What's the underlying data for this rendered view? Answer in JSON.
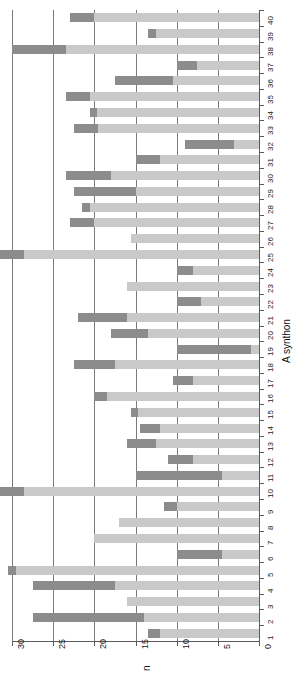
{
  "chart_data": {
    "type": "bar",
    "orientation": "horizontal-rotated",
    "title": "",
    "xlabel": "n",
    "ylabel": "A synthon",
    "xlim": [
      0,
      30
    ],
    "xticks": [
      30,
      25,
      20,
      15,
      10,
      5,
      0
    ],
    "xtick_labels": [
      "30",
      "25",
      "20",
      "15",
      "10",
      "5",
      "0"
    ],
    "grid": true,
    "legend": "none",
    "categories": [
      "1",
      "2",
      "3",
      "4",
      "5",
      "6",
      "7",
      "8",
      "9",
      "10",
      "11",
      "12",
      "13",
      "14",
      "15",
      "16",
      "17",
      "18",
      "19",
      "20",
      "21",
      "22",
      "23",
      "24",
      "25",
      "26",
      "27",
      "28",
      "29",
      "30",
      "31",
      "32",
      "33",
      "34",
      "35",
      "36",
      "37",
      "38",
      "39",
      "40"
    ],
    "series": [
      {
        "name": "total",
        "color": "#c9c9c9",
        "values": [
          13.5,
          27.5,
          16.0,
          27.5,
          30.5,
          10.0,
          20.0,
          17.0,
          11.5,
          31.5,
          15.0,
          11.0,
          16.0,
          14.5,
          15.5,
          20.0,
          10.5,
          22.5,
          10.0,
          18.0,
          22.0,
          10.0,
          16.0,
          10.0,
          32.5,
          15.5,
          23.0,
          21.5,
          22.5,
          23.5,
          15.0,
          9.0,
          22.5,
          20.5,
          23.5,
          17.5,
          10.0,
          30.0,
          13.5,
          23.0
        ]
      },
      {
        "name": "segment",
        "color": "#8c8c8c",
        "values": [
          1.5,
          13.5,
          0.0,
          10.0,
          1.0,
          5.5,
          0.0,
          0.0,
          1.5,
          3.0,
          10.5,
          3.0,
          3.5,
          2.5,
          0.8,
          1.5,
          2.5,
          5.0,
          9.0,
          4.5,
          6.0,
          3.0,
          0.0,
          2.0,
          4.0,
          0.0,
          3.0,
          1.0,
          7.5,
          5.5,
          3.0,
          6.0,
          3.0,
          0.8,
          3.0,
          7.0,
          2.5,
          6.5,
          1.0,
          3.0
        ]
      }
    ]
  },
  "axes": {
    "x_title": "n",
    "y_title": "A synthon"
  },
  "colors": {
    "light_bar": "#c9c9c9",
    "dark_bar": "#8c8c8c",
    "axis": "#5b5b5b",
    "grid": "#7a7a7a",
    "background": "#ffffff"
  }
}
